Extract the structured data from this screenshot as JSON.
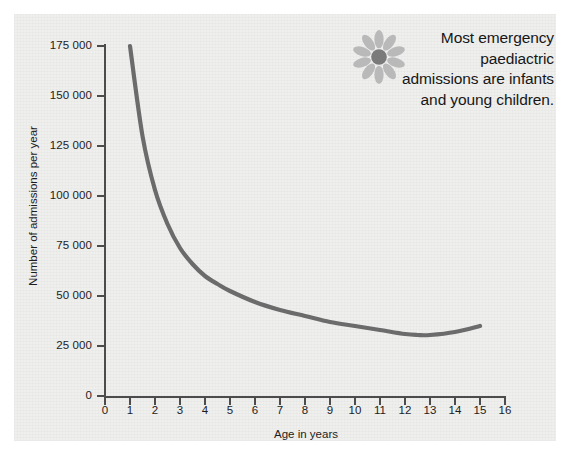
{
  "chart_data": {
    "type": "line",
    "title": "",
    "subtitle": "",
    "xlabel": "Age in years",
    "ylabel": "Number of admissions per year",
    "xlim": [
      0,
      16
    ],
    "ylim": [
      0,
      175000
    ],
    "grid": false,
    "legend": null,
    "x_ticks": [
      "0",
      "1",
      "2",
      "3",
      "4",
      "5",
      "6",
      "7",
      "8",
      "9",
      "10",
      "11",
      "12",
      "13",
      "14",
      "15",
      "16"
    ],
    "y_ticks": [
      "0",
      "25 000",
      "50 000",
      "75 000",
      "100 000",
      "125 000",
      "150 000",
      "175 000"
    ],
    "y_tick_values": [
      0,
      25000,
      50000,
      75000,
      100000,
      125000,
      150000,
      175000
    ],
    "series": [
      {
        "name": "Emergency paediatric admissions",
        "color": "#6b6b6b",
        "x": [
          1,
          1.5,
          2,
          2.5,
          3,
          3.5,
          4,
          4.5,
          5,
          6,
          7,
          8,
          9,
          10,
          11,
          12,
          12.5,
          13,
          14,
          15
        ],
        "values": [
          175000,
          130000,
          103000,
          86000,
          74000,
          66000,
          60000,
          56000,
          52500,
          47000,
          43000,
          40000,
          37000,
          35000,
          33000,
          31000,
          30500,
          30500,
          32000,
          35000
        ]
      }
    ],
    "annotations": [
      {
        "icon": "flower-icon",
        "text": "Most emergency paediactric admissions are infants and young children.",
        "lines": [
          "Most emergency",
          "paediactric",
          "admissions are infants",
          "and young children."
        ]
      }
    ],
    "colors": {
      "line": "#6b6b6b",
      "axis": "#4c4c4c",
      "text": "#1d1d1d",
      "panel_background": "#efefee",
      "page_background": "#ffffff",
      "flower_petal": "#b9b9b9",
      "flower_center": "#7a7a7a"
    }
  }
}
